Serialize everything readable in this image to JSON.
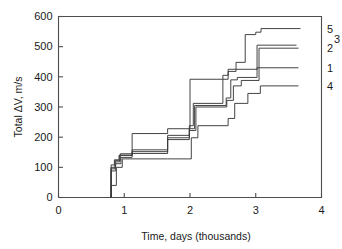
{
  "chart_data": {
    "type": "line",
    "subtype": "step-post",
    "title": "",
    "xlabel": "Time, days (thousands)",
    "ylabel": "Total ΔV, m/s",
    "xlim": [
      0,
      4
    ],
    "ylim": [
      0,
      600
    ],
    "xticks": [
      0,
      1,
      2,
      3,
      4
    ],
    "xticklabels": [
      "0",
      "1",
      "2",
      "3",
      "4"
    ],
    "yticks": [
      0,
      100,
      200,
      300,
      400,
      500,
      600
    ],
    "yticklabels": [
      "0",
      "100",
      "200",
      "300",
      "400",
      "500",
      "600"
    ],
    "grid": false,
    "legend_position": "right-of-axes-inline",
    "series": [
      {
        "name": "1",
        "label": "1",
        "label_value": 430,
        "x": [
          0.8,
          0.8,
          0.86,
          0.86,
          0.93,
          0.93,
          1.12,
          1.12,
          1.66,
          1.66,
          1.99,
          1.99,
          2.07,
          2.07,
          2.55,
          2.55,
          2.62,
          2.62,
          2.72,
          2.72,
          3.02,
          3.02,
          3.65
        ],
        "y": [
          0,
          95,
          95,
          118,
          118,
          140,
          140,
          152,
          152,
          198,
          198,
          228,
          228,
          305,
          305,
          330,
          330,
          390,
          390,
          398,
          398,
          430,
          430
        ]
      },
      {
        "name": "2",
        "label": "2",
        "label_value": 495,
        "x": [
          0.8,
          0.8,
          0.87,
          0.87,
          0.95,
          0.95,
          1.12,
          1.12,
          1.66,
          1.66,
          1.99,
          1.99,
          2.09,
          2.09,
          2.56,
          2.56,
          2.66,
          2.66,
          2.78,
          2.78,
          3.05,
          3.05,
          3.65
        ],
        "y": [
          0,
          88,
          88,
          112,
          112,
          133,
          133,
          146,
          146,
          192,
          192,
          222,
          222,
          300,
          300,
          322,
          322,
          370,
          370,
          388,
          388,
          495,
          495
        ]
      },
      {
        "name": "3",
        "label": "3",
        "label_value": 505,
        "x": [
          0.8,
          0.8,
          0.85,
          0.85,
          0.92,
          0.92,
          1.12,
          1.12,
          1.66,
          1.66,
          1.99,
          1.99,
          2.05,
          2.05,
          2.5,
          2.5,
          2.58,
          2.58,
          2.7,
          2.7,
          3.02,
          3.02,
          3.62
        ],
        "y": [
          0,
          108,
          108,
          125,
          125,
          140,
          140,
          158,
          158,
          206,
          206,
          238,
          238,
          312,
          312,
          405,
          405,
          418,
          418,
          425,
          425,
          505,
          505
        ]
      },
      {
        "name": "4",
        "label": "4",
        "label_value": 370,
        "x": [
          0.8,
          0.8,
          0.88,
          0.88,
          0.97,
          0.97,
          1.12,
          1.12,
          1.66,
          1.66,
          2.02,
          2.02,
          2.12,
          2.12,
          2.58,
          2.58,
          2.68,
          2.68,
          2.88,
          2.88,
          3.07,
          3.07,
          3.65
        ],
        "y": [
          0,
          40,
          40,
          100,
          100,
          128,
          128,
          128,
          128,
          128,
          128,
          198,
          198,
          238,
          238,
          262,
          262,
          312,
          312,
          345,
          345,
          370,
          370
        ]
      },
      {
        "name": "5",
        "label": "5",
        "label_value": 560,
        "x": [
          0.8,
          0.8,
          0.86,
          0.86,
          0.94,
          0.94,
          1.12,
          1.12,
          1.66,
          1.66,
          2.0,
          2.0,
          2.58,
          2.58,
          2.7,
          2.7,
          2.84,
          2.84,
          3.0,
          3.0,
          3.08,
          3.08,
          3.68
        ],
        "y": [
          0,
          100,
          100,
          122,
          122,
          145,
          145,
          212,
          212,
          228,
          228,
          392,
          392,
          425,
          425,
          448,
          448,
          540,
          540,
          548,
          548,
          560,
          560
        ]
      }
    ]
  },
  "labels": {
    "y_axis_title": "Total ΔV, m/s",
    "x_axis_title": "Time, days (thousands)"
  },
  "colors": {
    "line": "#3a3a3a",
    "axis": "#4d4d4d",
    "text": "#1a1a1a",
    "background": "#ffffff"
  }
}
